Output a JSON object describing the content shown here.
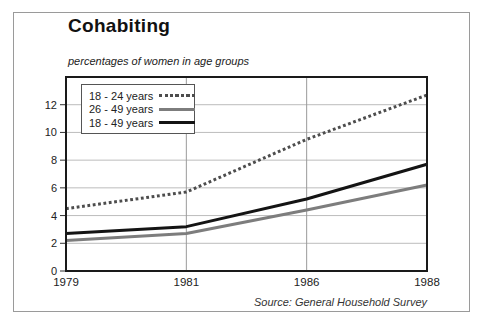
{
  "chart_data": {
    "type": "line",
    "title": "Cohabiting",
    "subtitle": "percentages of women in age groups",
    "source": "Source: General Household Survey",
    "categories": [
      "1979",
      "1981",
      "1986",
      "1988"
    ],
    "series": [
      {
        "name": "18 - 24 years",
        "style": "dotted",
        "color": "#4d4d4d",
        "values": [
          4.5,
          5.7,
          9.5,
          12.7
        ]
      },
      {
        "name": "26 - 49 years",
        "style": "solid",
        "color": "#7d7d7d",
        "values": [
          2.2,
          2.7,
          4.4,
          6.2
        ]
      },
      {
        "name": "18 - 49 years",
        "style": "solid",
        "color": "#141414",
        "values": [
          2.7,
          3.2,
          5.2,
          7.7
        ]
      }
    ],
    "xlabel": "",
    "ylabel": "",
    "y_ticks": [
      0,
      2,
      4,
      6,
      8,
      10,
      12
    ],
    "ylim": [
      0,
      14
    ],
    "grid": {
      "horizontal": true,
      "vertical_at": [
        "1981",
        "1986"
      ]
    },
    "legend_position": "top-left",
    "colors": {
      "plot_border": "#1a1a1a",
      "h_gridline": "#bcbcbc",
      "v_gridline": "#9a9a9a",
      "tick_text": "#222222"
    }
  }
}
